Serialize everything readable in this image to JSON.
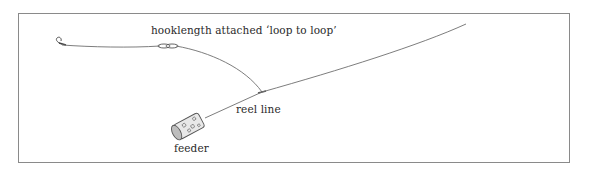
{
  "diagram": {
    "labels": {
      "hooklength": "hooklength attached ‘loop to loop’",
      "reel_line": "reel line",
      "feeder": "feeder"
    },
    "elements": [
      "hook",
      "hooklength",
      "loop-to-loop knot",
      "reel line",
      "swivel junction",
      "feeder"
    ],
    "colors": {
      "line": "#6e6e6e",
      "frame": "#8a8a8a",
      "text": "#2a2a2a"
    }
  }
}
